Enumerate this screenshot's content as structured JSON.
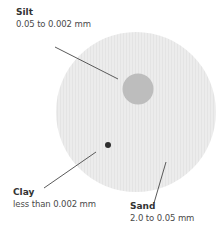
{
  "diagram": {
    "colors": {
      "sand_fill": "#ececec",
      "silt_fill": "#bdbdbd",
      "clay_fill": "#2e2e2e",
      "leader_line": "#5a5a5a",
      "text": "#333333"
    },
    "particles": [
      {
        "name": "Silt",
        "range": "0.05 to 0.002 mm"
      },
      {
        "name": "Clay",
        "range": "less than 0.002 mm"
      },
      {
        "name": "Sand",
        "range": "2.0 to 0.05 mm"
      }
    ]
  }
}
